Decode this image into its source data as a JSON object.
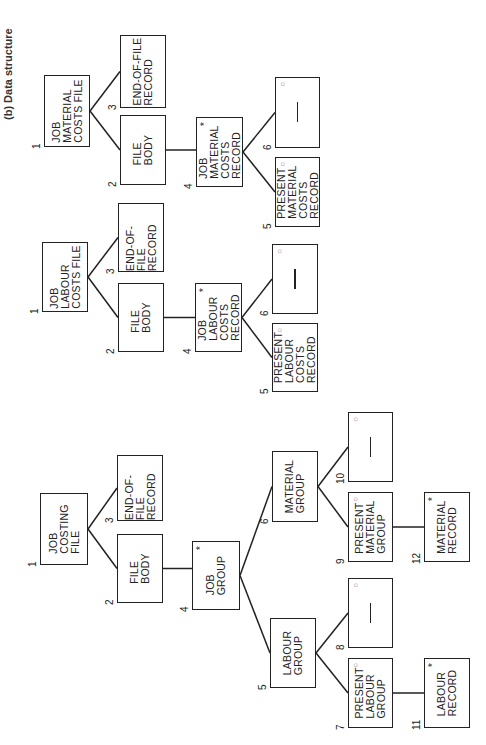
{
  "caption": "(b) Data structure",
  "trees": [
    {
      "name": "job-costing-file",
      "nodes": [
        {
          "id": 1,
          "label": "JOB\nCOSTING\nFILE",
          "mark": ""
        },
        {
          "id": 2,
          "label": "FILE\nBODY",
          "mark": ""
        },
        {
          "id": 3,
          "label": "END-OF-FILE\nRECORD",
          "mark": ""
        },
        {
          "id": 4,
          "label": "JOB\nGROUP",
          "mark": "*"
        },
        {
          "id": 5,
          "label": "LABOUR\nGROUP",
          "mark": ""
        },
        {
          "id": 6,
          "label": "MATERIAL\nGROUP",
          "mark": ""
        },
        {
          "id": 7,
          "label": "PRESENT\nLABOUR\nGROUP",
          "mark": "o"
        },
        {
          "id": 8,
          "label": "—",
          "mark": "o"
        },
        {
          "id": 9,
          "label": "PRESENT\nMATERIAL\nGROUP",
          "mark": "o"
        },
        {
          "id": 10,
          "label": "—",
          "mark": "o"
        },
        {
          "id": 11,
          "label": "LABOUR\nRECORD",
          "mark": "*"
        },
        {
          "id": 12,
          "label": "MATERIAL\nRECORD",
          "mark": "*"
        }
      ]
    },
    {
      "name": "job-labour-costs-file",
      "nodes": [
        {
          "id": 1,
          "label": "JOB\nLABOUR\nCOSTS FILE",
          "mark": ""
        },
        {
          "id": 2,
          "label": "FILE\nBODY",
          "mark": ""
        },
        {
          "id": 3,
          "label": "END-OF-FILE\nRECORD",
          "mark": ""
        },
        {
          "id": 4,
          "label": "JOB\nLABOUR\nCOSTS\nRECORD",
          "mark": "*"
        },
        {
          "id": 5,
          "label": "PRESENT\nLABOUR\nCOSTS\nRECORD",
          "mark": "o"
        },
        {
          "id": 6,
          "label": "—",
          "mark": "o"
        }
      ]
    },
    {
      "name": "job-material-costs-file",
      "nodes": [
        {
          "id": 1,
          "label": "JOB\nMATERIAL\nCOSTS FILE",
          "mark": ""
        },
        {
          "id": 2,
          "label": "FILE\nBODY",
          "mark": ""
        },
        {
          "id": 3,
          "label": "END-OF-FILE\nRECORD",
          "mark": ""
        },
        {
          "id": 4,
          "label": "JOB\nMATERIAL\nCOSTS\nRECORD",
          "mark": "*"
        },
        {
          "id": 5,
          "label": "PRESENT\nMATERIAL\nCOSTS\nRECORD",
          "mark": "o"
        },
        {
          "id": 6,
          "label": "—",
          "mark": "o"
        }
      ]
    }
  ]
}
